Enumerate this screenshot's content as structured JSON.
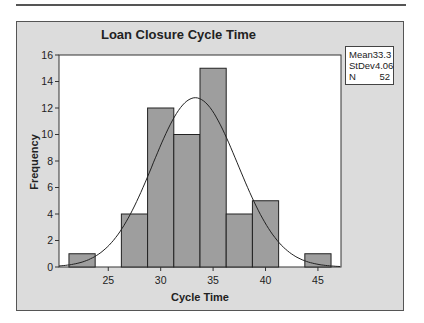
{
  "chart_data": {
    "type": "bar",
    "title": "Loan Closure Cycle Time",
    "xlabel": "Cycle Time",
    "ylabel": "Frequency",
    "bin_width": 2.5,
    "bin_edges": [
      21.25,
      23.75,
      26.25,
      28.75,
      31.25,
      33.75,
      36.25,
      38.75,
      41.25,
      43.75,
      46.25
    ],
    "categories": [
      "22.5",
      "25",
      "27.5",
      "30",
      "32.5",
      "35",
      "37.5",
      "40",
      "42.5",
      "45"
    ],
    "values": [
      1,
      0,
      4,
      12,
      10,
      15,
      4,
      5,
      0,
      1
    ],
    "xlim": [
      20.3,
      47.2
    ],
    "ylim": [
      0,
      16
    ],
    "xticks": [
      25,
      30,
      35,
      40,
      45
    ],
    "yticks": [
      0,
      2,
      4,
      6,
      8,
      10,
      12,
      14,
      16
    ],
    "overlay": {
      "type": "normal_curve",
      "mean": 33.3,
      "stdev": 4.06,
      "n": 52
    },
    "legend_position": "top-right",
    "grid": false
  },
  "stats_box": [
    {
      "label": "Mean",
      "value": "33.3"
    },
    {
      "label": "StDev",
      "value": "4.06"
    },
    {
      "label": "N",
      "value": "52"
    }
  ],
  "colors": {
    "bar_fill": "#9e9e9e",
    "bar_stroke": "#222222",
    "panel_bg": "#dcdcdc",
    "plot_bg": "#ffffff",
    "curve": "#222222"
  }
}
